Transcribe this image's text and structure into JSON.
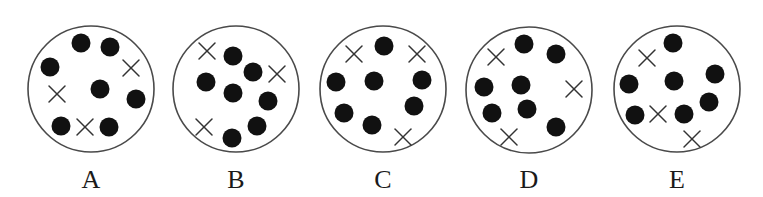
{
  "figure": {
    "panels": [
      {
        "label": "A",
        "center": [
          91,
          89
        ],
        "radius": 63,
        "dots": [
          [
            81,
            43
          ],
          [
            110,
            47
          ],
          [
            50,
            67
          ],
          [
            100,
            89
          ],
          [
            136,
            99
          ],
          [
            61,
            126
          ],
          [
            109,
            127
          ]
        ],
        "crosses": [
          [
            131,
            68
          ],
          [
            57,
            94
          ],
          [
            85,
            127
          ]
        ]
      },
      {
        "label": "B",
        "center": [
          236,
          89
        ],
        "radius": 63,
        "dots": [
          [
            233,
            56
          ],
          [
            253,
            72
          ],
          [
            206,
            82
          ],
          [
            233,
            93
          ],
          [
            268,
            101
          ],
          [
            257,
            126
          ],
          [
            232,
            138
          ]
        ],
        "crosses": [
          [
            207,
            51
          ],
          [
            277,
            74
          ],
          [
            204,
            127
          ]
        ]
      },
      {
        "label": "C",
        "center": [
          383,
          89
        ],
        "radius": 63,
        "dots": [
          [
            384,
            46
          ],
          [
            336,
            82
          ],
          [
            374,
            81
          ],
          [
            422,
            80
          ],
          [
            344,
            113
          ],
          [
            372,
            125
          ],
          [
            414,
            106
          ]
        ],
        "crosses": [
          [
            354,
            54
          ],
          [
            417,
            54
          ],
          [
            403,
            137
          ]
        ]
      },
      {
        "label": "D",
        "center": [
          529,
          90
        ],
        "radius": 63,
        "dots": [
          [
            524,
            44
          ],
          [
            556,
            54
          ],
          [
            484,
            87
          ],
          [
            521,
            85
          ],
          [
            492,
            113
          ],
          [
            527,
            109
          ],
          [
            556,
            127
          ]
        ],
        "crosses": [
          [
            496,
            57
          ],
          [
            574,
            89
          ],
          [
            509,
            137
          ]
        ]
      },
      {
        "label": "E",
        "center": [
          677,
          89
        ],
        "radius": 63,
        "dots": [
          [
            673,
            43
          ],
          [
            629,
            84
          ],
          [
            674,
            81
          ],
          [
            715,
            74
          ],
          [
            709,
            102
          ],
          [
            635,
            115
          ],
          [
            684,
            114
          ]
        ],
        "crosses": [
          [
            647,
            58
          ],
          [
            658,
            114
          ],
          [
            692,
            139
          ]
        ]
      }
    ],
    "dot_radius": 9.5,
    "cross_half_size": 8,
    "label_y": 188
  }
}
